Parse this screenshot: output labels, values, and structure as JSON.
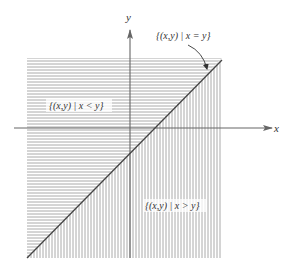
{
  "diagram": {
    "type": "set-regions-on-cartesian-plane",
    "axes": {
      "x_label": "x",
      "y_label": "y"
    },
    "regions": [
      {
        "id": "upper-left",
        "label": "{(x,y) | x < y}",
        "hatch": "horizontal"
      },
      {
        "id": "lower-right",
        "label": "{(x,y) | x > y}",
        "hatch": "vertical"
      }
    ],
    "line": {
      "id": "diagonal",
      "label": "{(x,y) | x = y}",
      "equation": "y = x"
    },
    "colors": {
      "hatch": "#9a9a9a",
      "axis": "#666666",
      "diagonal": "#444444",
      "text": "#333333",
      "background": "#ffffff"
    }
  }
}
